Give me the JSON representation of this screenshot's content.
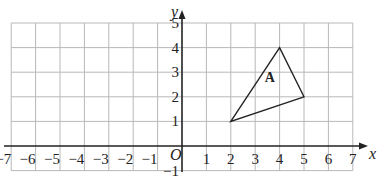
{
  "diagram": {
    "type": "coordinate-grid",
    "x_axis": {
      "label": "x",
      "min": -7,
      "max": 7,
      "ticks": [
        "−7",
        "−6",
        "−5",
        "−4",
        "−3",
        "−2",
        "−1",
        "1",
        "2",
        "3",
        "4",
        "5",
        "6",
        "7"
      ]
    },
    "y_axis": {
      "label": "y",
      "min": -1,
      "max": 5,
      "ticks": [
        "−1",
        "1",
        "2",
        "3",
        "4",
        "5"
      ]
    },
    "origin_label": "O",
    "shapes": [
      {
        "name": "A",
        "label": "A",
        "type": "triangle",
        "vertices": [
          [
            2,
            1
          ],
          [
            4,
            4
          ],
          [
            5,
            2
          ]
        ],
        "label_position": [
          3.6,
          2.6
        ]
      }
    ],
    "colors": {
      "grid": "#b8b8b8",
      "axis": "#222222",
      "shape": "#222222",
      "background": "#ffffff"
    }
  }
}
